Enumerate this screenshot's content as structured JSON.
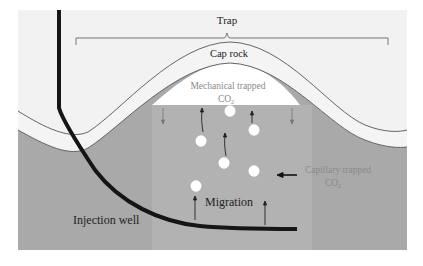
{
  "diagram": {
    "labels": {
      "trap": "Trap",
      "cap_rock": "Cap rock",
      "mechanical_line1": "Mechanical trapped",
      "mechanical_line2": "CO",
      "mechanical_sub": "2",
      "capillary_line1": "Capillary trapped",
      "capillary_line2": "CO",
      "capillary_sub": "2",
      "migration": "Migration",
      "injection_well": "Injection well"
    },
    "colors": {
      "page_bg": "#ffffff",
      "upper_bg": "#f2f2f2",
      "cap_rock": "#f4f4f4",
      "reservoir": "#a9a9a9",
      "plume": "#b4b4b4",
      "trapped_gas": "#ffffff",
      "bubble": "#ffffff",
      "well": "#151515",
      "line": "#555555",
      "muted_text": "#8a8a8a",
      "text": "#222222"
    },
    "bubbles": [
      {
        "cx": 230,
        "cy": 111
      },
      {
        "cx": 201,
        "cy": 141
      },
      {
        "cx": 254,
        "cy": 130
      },
      {
        "cx": 224,
        "cy": 163
      },
      {
        "cx": 254,
        "cy": 171
      },
      {
        "cx": 196,
        "cy": 186
      }
    ]
  }
}
